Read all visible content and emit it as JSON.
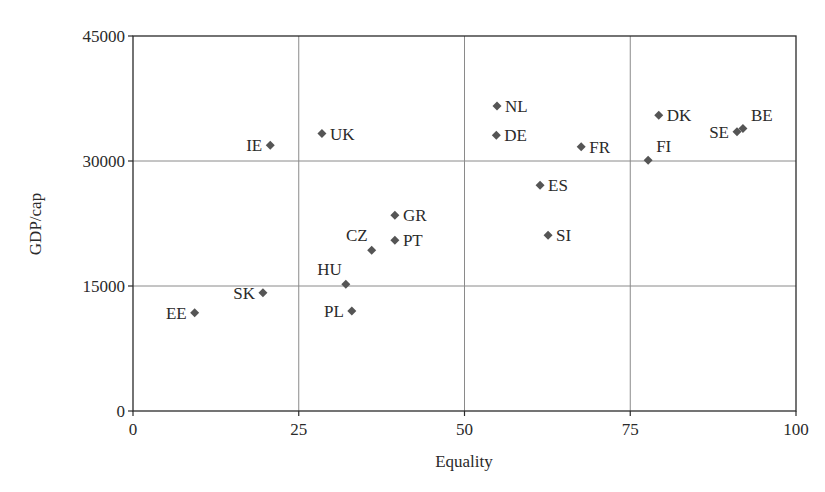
{
  "chart_data": {
    "type": "scatter",
    "title": "",
    "xlabel": "Equality",
    "ylabel": "GDP/cap",
    "xlim": [
      0,
      100
    ],
    "ylim": [
      0,
      45000
    ],
    "x_ticks": [
      0,
      25,
      50,
      75,
      100
    ],
    "y_ticks": [
      0,
      15000,
      30000,
      45000
    ],
    "grid": true,
    "legend": null,
    "marker": "diamond",
    "marker_color": "#555555",
    "points": [
      {
        "label": "EE",
        "x": 9.3,
        "y": 11800,
        "label_pos": "left"
      },
      {
        "label": "SK",
        "x": 19.6,
        "y": 14200,
        "label_pos": "left"
      },
      {
        "label": "IE",
        "x": 20.7,
        "y": 31900,
        "label_pos": "left"
      },
      {
        "label": "UK",
        "x": 28.5,
        "y": 33300,
        "label_pos": "right"
      },
      {
        "label": "HU",
        "x": 32.1,
        "y": 15200,
        "label_pos": "top-left"
      },
      {
        "label": "PL",
        "x": 33.0,
        "y": 12000,
        "label_pos": "left"
      },
      {
        "label": "CZ",
        "x": 36.0,
        "y": 19300,
        "label_pos": "top-left"
      },
      {
        "label": "GR",
        "x": 39.5,
        "y": 23500,
        "label_pos": "right"
      },
      {
        "label": "PT",
        "x": 39.5,
        "y": 20500,
        "label_pos": "right"
      },
      {
        "label": "NL",
        "x": 54.9,
        "y": 36600,
        "label_pos": "right"
      },
      {
        "label": "DE",
        "x": 54.8,
        "y": 33100,
        "label_pos": "right"
      },
      {
        "label": "ES",
        "x": 61.4,
        "y": 27100,
        "label_pos": "right"
      },
      {
        "label": "SI",
        "x": 62.6,
        "y": 21100,
        "label_pos": "right"
      },
      {
        "label": "FR",
        "x": 67.6,
        "y": 31700,
        "label_pos": "right"
      },
      {
        "label": "FI",
        "x": 77.7,
        "y": 30100,
        "label_pos": "top-right"
      },
      {
        "label": "DK",
        "x": 79.3,
        "y": 35500,
        "label_pos": "right"
      },
      {
        "label": "SE",
        "x": 91.1,
        "y": 33500,
        "label_pos": "left"
      },
      {
        "label": "BE",
        "x": 92.0,
        "y": 33900,
        "label_pos": "top-right"
      }
    ]
  }
}
